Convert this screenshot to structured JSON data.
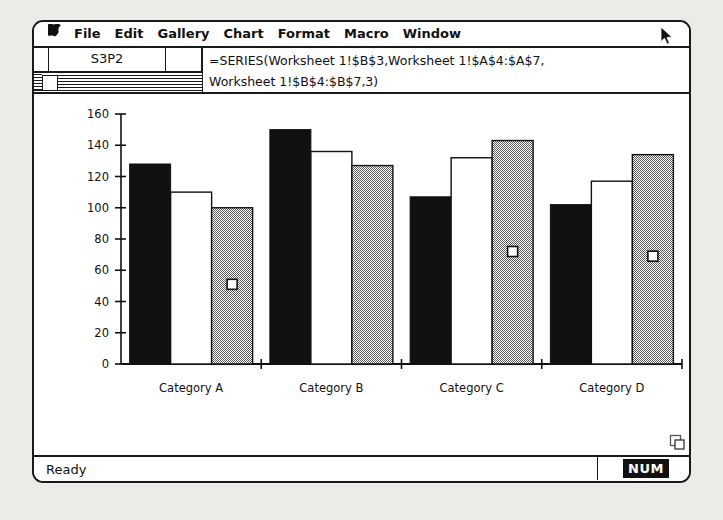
{
  "app": {
    "status_left": "Ready",
    "status_indicator": "NUM"
  },
  "menubar": {
    "apple_glyph": "⌘",
    "items": [
      {
        "label": "File"
      },
      {
        "label": "Edit"
      },
      {
        "label": "Gallery"
      },
      {
        "label": "Chart"
      },
      {
        "label": "Format"
      },
      {
        "label": "Macro"
      },
      {
        "label": "Window"
      }
    ]
  },
  "formula_bar": {
    "name_box": "S3P2",
    "formula": "=SERIES(Worksheet 1!$B$3,Worksheet 1!$A$4:$A$7,\nWorksheet 1!$B$4:$B$7,3)"
  },
  "colors": {
    "series_1": "#111111",
    "series_2": "#ffffff",
    "series_3": "#9a9a9a",
    "frame": "#1a1a1a",
    "window_bg": "#ffffff",
    "desktop": "#edebe7",
    "selection_handle": "#ffffff"
  },
  "chart_data": {
    "type": "bar",
    "title": "",
    "xlabel": "",
    "ylabel": "",
    "categories": [
      "Category A",
      "Category B",
      "Category C",
      "Category D"
    ],
    "series": [
      {
        "name": "Series 1",
        "fill": "black",
        "values": [
          128,
          150,
          107,
          102
        ]
      },
      {
        "name": "Series 2",
        "fill": "white",
        "values": [
          110,
          136,
          132,
          117
        ]
      },
      {
        "name": "Series 3",
        "fill": "gray",
        "values": [
          100,
          127,
          143,
          134
        ]
      }
    ],
    "yticks": [
      0,
      20,
      40,
      60,
      80,
      100,
      120,
      140,
      160
    ],
    "ylim": [
      0,
      160
    ],
    "grid": false,
    "legend": "none",
    "selected_series": 3,
    "selection_handle_values": [
      51,
      null,
      72,
      69
    ]
  }
}
